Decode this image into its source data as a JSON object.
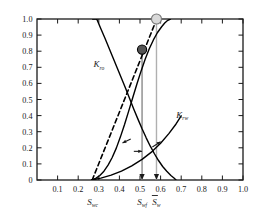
{
  "chart_data": {
    "type": "line",
    "title": "",
    "xlabel": "",
    "ylabel": "",
    "xlim": [
      0.0,
      1.0
    ],
    "ylim": [
      0.0,
      1.0
    ],
    "grid": false,
    "legend_position": "inline-curve-labels",
    "x_ticks": [
      "0.1",
      "0.2",
      "0.3",
      "0.4",
      "0.5",
      "0.6",
      "0.7",
      "0.8",
      "0.9",
      "1.0"
    ],
    "x_tick_values": [
      0.1,
      0.2,
      0.3,
      0.4,
      0.5,
      0.6,
      0.7,
      0.8,
      0.9,
      1.0
    ],
    "y_ticks": [
      "0",
      "0.1",
      "0.2",
      "0.3",
      "0.4",
      "0.5",
      "0.6",
      "0.7",
      "0.8",
      "0.9",
      "1.0"
    ],
    "y_tick_values": [
      0,
      0.1,
      0.2,
      0.3,
      0.4,
      0.5,
      0.6,
      0.7,
      0.8,
      0.9,
      1.0
    ],
    "series": [
      {
        "name": "Kro",
        "label_base": "K",
        "label_sub": "ro",
        "style": "solid",
        "color": "#000000",
        "label_x": 0.3,
        "label_y": 0.7,
        "points": [
          [
            0.27,
            1.0
          ],
          [
            0.29,
            1.0
          ],
          [
            0.31,
            0.94
          ],
          [
            0.33,
            0.88
          ],
          [
            0.35,
            0.818
          ],
          [
            0.37,
            0.756
          ],
          [
            0.39,
            0.694
          ],
          [
            0.41,
            0.632
          ],
          [
            0.43,
            0.57
          ],
          [
            0.45,
            0.505
          ],
          [
            0.47,
            0.44
          ],
          [
            0.49,
            0.378
          ],
          [
            0.51,
            0.318
          ],
          [
            0.53,
            0.262
          ],
          [
            0.55,
            0.21
          ],
          [
            0.57,
            0.163
          ],
          [
            0.59,
            0.121
          ],
          [
            0.61,
            0.084
          ],
          [
            0.63,
            0.054
          ],
          [
            0.65,
            0.028
          ],
          [
            0.665,
            0.012
          ],
          [
            0.675,
            0.0
          ]
        ]
      },
      {
        "name": "Krw",
        "label_base": "K",
        "label_sub": "rw",
        "style": "solid",
        "color": "#000000",
        "label_x": 0.705,
        "label_y": 0.385,
        "points": [
          [
            0.265,
            0.0
          ],
          [
            0.285,
            0.01
          ],
          [
            0.305,
            0.028
          ],
          [
            0.325,
            0.055
          ],
          [
            0.345,
            0.092
          ],
          [
            0.365,
            0.14
          ],
          [
            0.385,
            0.198
          ],
          [
            0.405,
            0.268
          ],
          [
            0.425,
            0.345
          ],
          [
            0.445,
            0.428
          ],
          [
            0.465,
            0.512
          ],
          [
            0.485,
            0.596
          ],
          [
            0.505,
            0.676
          ],
          [
            0.525,
            0.75
          ],
          [
            0.545,
            0.815
          ],
          [
            0.565,
            0.87
          ],
          [
            0.585,
            0.916
          ],
          [
            0.605,
            0.952
          ],
          [
            0.62,
            0.975
          ],
          [
            0.635,
            0.992
          ],
          [
            0.648,
            1.0
          ]
        ]
      },
      {
        "name": "Krw-lower-branch",
        "label_base": "",
        "label_sub": "",
        "style": "solid",
        "color": "#000000",
        "label_x": null,
        "label_y": null,
        "points": [
          [
            0.265,
            0.0
          ],
          [
            0.31,
            0.012
          ],
          [
            0.36,
            0.03
          ],
          [
            0.41,
            0.055
          ],
          [
            0.46,
            0.088
          ],
          [
            0.51,
            0.128
          ],
          [
            0.56,
            0.178
          ],
          [
            0.6,
            0.228
          ],
          [
            0.64,
            0.288
          ],
          [
            0.675,
            0.348
          ],
          [
            0.7,
            0.398
          ]
        ]
      },
      {
        "name": "tangent-line",
        "label_base": "",
        "label_sub": "",
        "style": "dashed",
        "color": "#000000",
        "label_x": null,
        "label_y": null,
        "points": [
          [
            0.268,
            0.0
          ],
          [
            0.6,
            1.06
          ]
        ]
      }
    ],
    "markers": [
      {
        "name": "front-saturation-point",
        "x": 0.51,
        "y": 0.81,
        "fill": "#555555",
        "stroke": "#000000",
        "r": 4.6
      },
      {
        "name": "breakthrough-point",
        "x": 0.58,
        "y": 1.0,
        "fill": "#d9d9d9",
        "stroke": "#777777",
        "r": 5.0
      }
    ],
    "drop_lines": [
      {
        "name": "swf-drop-line",
        "x": 0.51,
        "from_y": 0.81,
        "to_y": 0.0,
        "color": "#8a8a8a"
      },
      {
        "name": "sw-drop-line",
        "x": 0.58,
        "from_y": 1.0,
        "to_y": 0.0,
        "color": "#b0b0b0"
      }
    ],
    "annotation_arrows": [
      {
        "name": "kro-direction-arrow",
        "x1": 0.455,
        "y1": 0.255,
        "x2": 0.415,
        "y2": 0.23
      },
      {
        "name": "krw-direction-arrow",
        "x1": 0.56,
        "y1": 0.205,
        "x2": 0.6,
        "y2": 0.238
      },
      {
        "name": "left-tick-arrow",
        "x1": 0.47,
        "y1": 0.178,
        "x2": 0.51,
        "y2": 0.178
      }
    ],
    "axis_annotations": [
      {
        "name": "swc",
        "base": "S",
        "sub": "wc",
        "x": 0.27
      },
      {
        "name": "swf",
        "base": "S",
        "sub": "wf",
        "x": 0.51
      },
      {
        "name": "sw",
        "base": "S",
        "sub": "w",
        "x": 0.58,
        "overbar": true
      }
    ]
  }
}
